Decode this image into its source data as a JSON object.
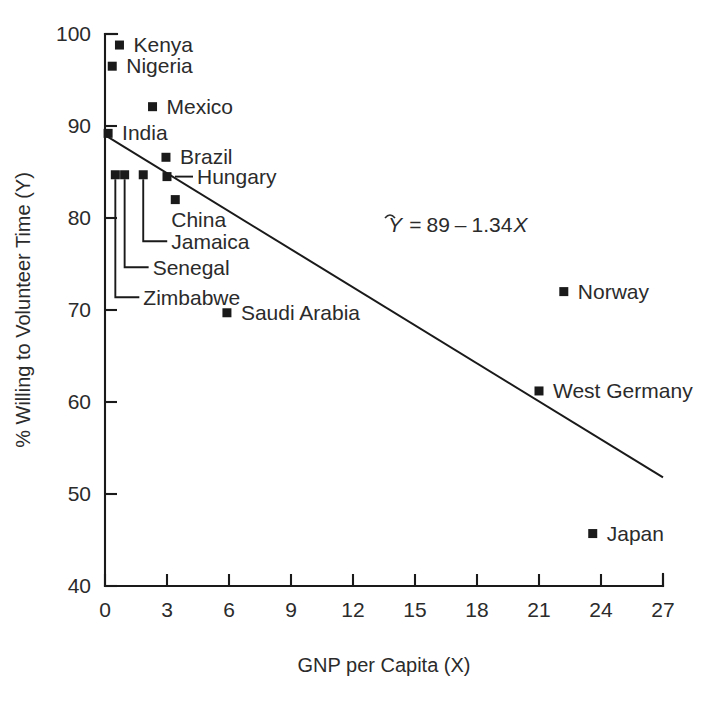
{
  "chart_data": {
    "type": "scatter",
    "title": "",
    "xlabel": "GNP per Capita (X)",
    "ylabel": "% Willing to Volunteer Time (Y)",
    "xlim": [
      0,
      27
    ],
    "ylim": [
      40,
      100
    ],
    "xticks": [
      0,
      3,
      6,
      9,
      12,
      15,
      18,
      21,
      24,
      27
    ],
    "yticks": [
      40,
      50,
      60,
      70,
      80,
      90,
      100
    ],
    "grid": false,
    "legend": "none",
    "marker_color": "#1a1a1a",
    "line_color": "#1a1a1a",
    "annotation": {
      "text": "Y = 89 - 1.34X",
      "y_hat": "Y",
      "equals": "=",
      "intercept": "89",
      "minus": "–",
      "slope": "1.34",
      "x_var": "X",
      "x": 15.0,
      "y": 78.5
    },
    "regression": {
      "intercept": 89,
      "slope": -1.34,
      "x_start": 0,
      "x_end": 27,
      "y_start": 89,
      "y_end": 51.8
    },
    "points": [
      {
        "label": "Kenya",
        "x": 0.7,
        "y": 98.8,
        "label_side": "right",
        "leader": "none"
      },
      {
        "label": "Nigeria",
        "x": 0.35,
        "y": 96.5,
        "label_side": "right",
        "leader": "none"
      },
      {
        "label": "Mexico",
        "x": 2.3,
        "y": 92.1,
        "label_side": "right",
        "leader": "none"
      },
      {
        "label": "India",
        "x": 0.15,
        "y": 89.2,
        "label_side": "right",
        "leader": "none"
      },
      {
        "label": "Brazil",
        "x": 2.95,
        "y": 86.6,
        "label_side": "right",
        "leader": "none"
      },
      {
        "label": "Hungary",
        "x": 3.0,
        "y": 84.5,
        "label_side": "right",
        "leader": "horizontal"
      },
      {
        "label": "China",
        "x": 3.4,
        "y": 82.0,
        "label_side": "below",
        "leader": "none"
      },
      {
        "label": "Jamaica",
        "x": 1.85,
        "y": 84.7,
        "label_side": "right",
        "leader": "elbow"
      },
      {
        "label": "Senegal",
        "x": 0.95,
        "y": 84.7,
        "label_side": "right",
        "leader": "elbow"
      },
      {
        "label": "Zimbabwe",
        "x": 0.5,
        "y": 84.7,
        "label_side": "right",
        "leader": "elbow"
      },
      {
        "label": "Saudi Arabia",
        "x": 5.9,
        "y": 69.7,
        "label_side": "right",
        "leader": "none"
      },
      {
        "label": "Norway",
        "x": 22.2,
        "y": 72.0,
        "label_side": "right",
        "leader": "none"
      },
      {
        "label": "West Germany",
        "x": 21.0,
        "y": 61.2,
        "label_side": "right",
        "leader": "none"
      },
      {
        "label": "Japan",
        "x": 23.6,
        "y": 45.7,
        "label_side": "right",
        "leader": "none"
      }
    ]
  }
}
